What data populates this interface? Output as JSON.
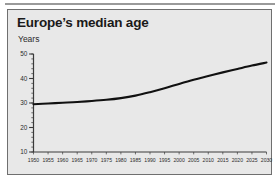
{
  "figure": {
    "title": "Europe’s median age",
    "subtitle": "Years"
  },
  "colors": {
    "panel_background": "#e8e8e8",
    "panel_border": "#6f6f6f",
    "line": "#111111",
    "axis": "#3a3a3a",
    "text": "#1a1a1a",
    "page_background": "#ffffff",
    "top_rule": "#9a9a9a"
  },
  "chart_data": {
    "type": "line",
    "title": "Europe’s median age",
    "xlabel": "",
    "ylabel": "Years",
    "ylim": [
      10,
      50
    ],
    "xlim": [
      1950,
      2030
    ],
    "grid": false,
    "legend": null,
    "y_ticks": [
      10,
      20,
      30,
      40,
      50
    ],
    "y_minor_tick_step": 2,
    "x_ticks": [
      1950,
      1955,
      1960,
      1965,
      1970,
      1975,
      1980,
      1985,
      1990,
      1995,
      2000,
      2005,
      2010,
      2015,
      2020,
      2025,
      2030
    ],
    "x": [
      1950,
      1955,
      1960,
      1965,
      1970,
      1975,
      1980,
      1985,
      1990,
      1995,
      2000,
      2005,
      2010,
      2015,
      2020,
      2025,
      2030
    ],
    "values": [
      29.5,
      29.8,
      30.1,
      30.4,
      30.8,
      31.3,
      32.0,
      33.0,
      34.4,
      36.0,
      37.8,
      39.5,
      41.0,
      42.5,
      43.9,
      45.3,
      46.5
    ],
    "series": [
      {
        "name": "Europe median age",
        "values": [
          29.5,
          29.8,
          30.1,
          30.4,
          30.8,
          31.3,
          32.0,
          33.0,
          34.4,
          36.0,
          37.8,
          39.5,
          41.0,
          42.5,
          43.9,
          45.3,
          46.5
        ]
      }
    ]
  }
}
